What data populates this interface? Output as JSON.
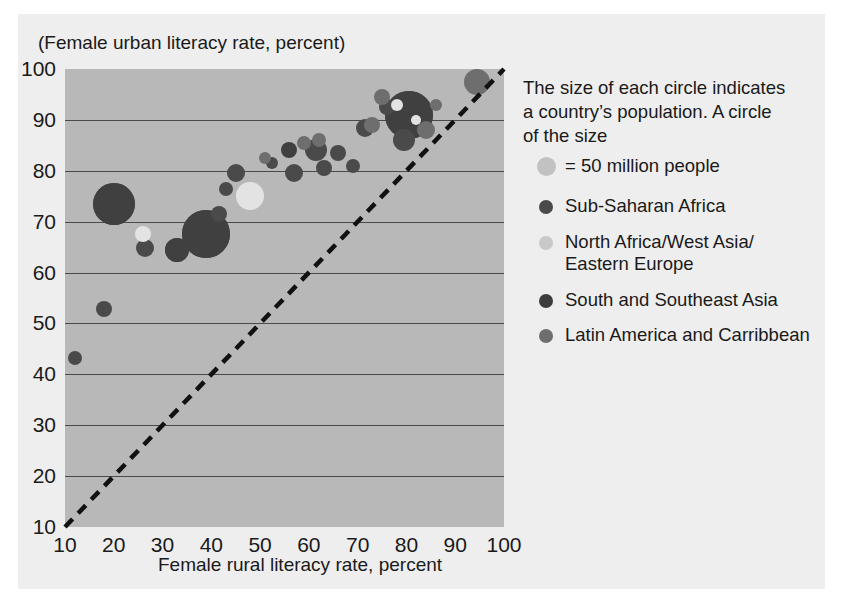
{
  "chart_data": {
    "type": "scatter",
    "title": "",
    "xlabel": "Female rural literacy rate, percent",
    "ylabel": "(Female urban literacy rate, percent)",
    "xlim": [
      10,
      100
    ],
    "ylim": [
      10,
      100
    ],
    "xticks": [
      10,
      20,
      30,
      40,
      50,
      60,
      70,
      80,
      90,
      100
    ],
    "yticks": [
      10,
      20,
      30,
      40,
      50,
      60,
      70,
      80,
      90,
      100
    ],
    "grid": "horizontal",
    "reference_line": {
      "type": "45-degree dashed",
      "from": [
        10,
        10
      ],
      "to": [
        100,
        100
      ]
    },
    "size_encoding": "circle area proportional to country population",
    "legend_position": "right",
    "series": [
      {
        "name": "Sub-Saharan Africa",
        "color": "#4a4a4a",
        "points": [
          {
            "x": 20,
            "y": 73.5,
            "r": 21
          },
          {
            "x": 18,
            "y": 52.8,
            "r": 8
          },
          {
            "x": 12,
            "y": 43.2,
            "r": 7
          },
          {
            "x": 26.5,
            "y": 64.8,
            "r": 9
          },
          {
            "x": 33,
            "y": 64.5,
            "r": 12
          },
          {
            "x": 39,
            "y": 67.5,
            "r": 24
          },
          {
            "x": 41.5,
            "y": 71.5,
            "r": 8
          },
          {
            "x": 45,
            "y": 79.5,
            "r": 9
          },
          {
            "x": 43,
            "y": 76.5,
            "r": 7
          },
          {
            "x": 52.5,
            "y": 81.5,
            "r": 6
          },
          {
            "x": 57,
            "y": 79.5,
            "r": 9
          },
          {
            "x": 61.5,
            "y": 84,
            "r": 11
          },
          {
            "x": 63,
            "y": 80.5,
            "r": 8
          },
          {
            "x": 66,
            "y": 83.5,
            "r": 8
          },
          {
            "x": 71.5,
            "y": 88.5,
            "r": 9
          },
          {
            "x": 69,
            "y": 81,
            "r": 7
          },
          {
            "x": 76,
            "y": 92.5,
            "r": 8
          },
          {
            "x": 79.5,
            "y": 86,
            "r": 11
          },
          {
            "x": 80.5,
            "y": 91,
            "r": 24
          }
        ]
      },
      {
        "name": "North Africa/West Asia/Eastern Europe",
        "color": "#e3e3e3",
        "points": [
          {
            "x": 48,
            "y": 75,
            "r": 14
          },
          {
            "x": 26,
            "y": 67.5,
            "r": 8
          },
          {
            "x": 78,
            "y": 93,
            "r": 6
          },
          {
            "x": 82,
            "y": 90,
            "r": 5
          }
        ]
      },
      {
        "name": "South and Southeast Asia",
        "color": "#404040",
        "points": [
          {
            "x": 39,
            "y": 67.5,
            "r": 24
          },
          {
            "x": 20,
            "y": 73.5,
            "r": 21
          },
          {
            "x": 80.5,
            "y": 91,
            "r": 24
          },
          {
            "x": 33,
            "y": 64.5,
            "r": 12
          },
          {
            "x": 56,
            "y": 84,
            "r": 8
          }
        ]
      },
      {
        "name": "Latin America and Carribbean",
        "color": "#6e6e6e",
        "points": [
          {
            "x": 62,
            "y": 86,
            "r": 7
          },
          {
            "x": 73,
            "y": 89,
            "r": 8
          },
          {
            "x": 75,
            "y": 94.5,
            "r": 8
          },
          {
            "x": 86,
            "y": 93,
            "r": 6
          },
          {
            "x": 94.5,
            "y": 97.5,
            "r": 13
          },
          {
            "x": 84,
            "y": 88,
            "r": 9
          },
          {
            "x": 51,
            "y": 82.5,
            "r": 6
          },
          {
            "x": 59,
            "y": 85.5,
            "r": 7
          }
        ]
      }
    ]
  },
  "legend": {
    "note_line1": "The size of each circle indicates",
    "note_line2": "a country’s population. A circle",
    "note_line3": "of the size",
    "size_label": "= 50 million people",
    "size_swatch_color": "#c2c2c2",
    "items": [
      {
        "label": "Sub-Saharan Africa",
        "color": "#4a4a4a"
      },
      {
        "label": "North Africa/West Asia/\nEastern Europe",
        "color": "#c9c9c9"
      },
      {
        "label": "South and Southeast Asia",
        "color": "#3d3d3d"
      },
      {
        "label": "Latin America and Carribbean",
        "color": "#6e6e6e"
      }
    ]
  },
  "axes": {
    "y_title": "(Female urban literacy rate, percent)",
    "x_title": "Female rural literacy rate, percent"
  }
}
